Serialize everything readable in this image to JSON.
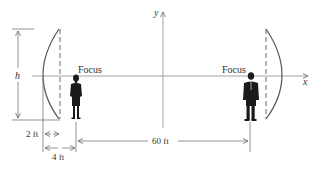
{
  "diagram": {
    "type": "parabolic reflectors whispering gallery",
    "axes": {
      "x_label": "x",
      "y_label": "y"
    },
    "left_focus_label": "Focus",
    "right_focus_label": "Focus",
    "dimensions": {
      "height_label": "h",
      "depth_label": "2 ft",
      "focus_distance_label": "4 ft",
      "separation_label": "60 ft"
    },
    "figures": [
      {
        "name": "woman",
        "position": "left focus"
      },
      {
        "name": "man",
        "position": "right focus"
      }
    ],
    "colors": {
      "line": "#555555",
      "axis": "#888888",
      "figure": "#1a1a1a",
      "text": "#333333"
    }
  }
}
